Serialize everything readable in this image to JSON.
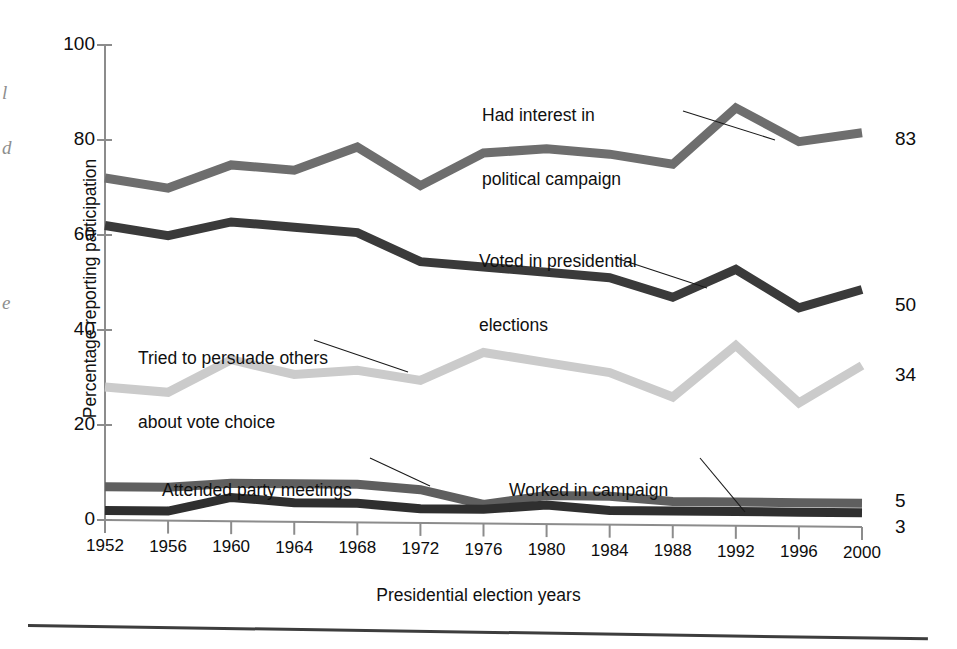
{
  "chart_data": {
    "type": "line",
    "title": "",
    "xlabel": "Presidential election years",
    "ylabel": "Percentage reporting participation",
    "categories": [
      "1952",
      "1956",
      "1960",
      "1964",
      "1968",
      "1972",
      "1976",
      "1980",
      "1984",
      "1988",
      "1992",
      "1996",
      "2000"
    ],
    "x": [
      1952,
      1956,
      1960,
      1964,
      1968,
      1972,
      1976,
      1980,
      1984,
      1988,
      1992,
      1996,
      2000
    ],
    "ylim": [
      0,
      100
    ],
    "yticks": [
      0,
      20,
      40,
      60,
      80,
      100
    ],
    "grid": false,
    "legend_position": "inline-annotations",
    "series": [
      {
        "name": "Had interest in political campaign",
        "color": "#6e6e6e",
        "end_value": 83,
        "values": [
          72,
          70,
          75,
          74,
          79,
          71,
          78,
          79,
          78,
          76,
          88,
          81,
          83
        ]
      },
      {
        "name": "Voted in presidential elections",
        "color": "#3a3a3a",
        "end_value": 50,
        "values": [
          62,
          60,
          63,
          62,
          61,
          55,
          54,
          53,
          52,
          48,
          54,
          46,
          50
        ]
      },
      {
        "name": "Tried to persuade others about vote choice",
        "color": "#cbcbcb",
        "end_value": 34,
        "values": [
          28,
          27,
          34,
          31,
          32,
          30,
          36,
          34,
          32,
          27,
          38,
          26,
          34
        ]
      },
      {
        "name": "Attended party meetings",
        "color": "#5f5f5f",
        "end_value": 5,
        "values": [
          7,
          7,
          8,
          8,
          8,
          7,
          4,
          6,
          6,
          5,
          5,
          5,
          5
        ]
      },
      {
        "name": "Worked in campaign",
        "color": "#2f2f2f",
        "end_value": 3,
        "values": [
          2,
          2,
          5,
          4,
          4,
          3,
          3,
          4,
          3,
          3,
          3,
          3,
          3
        ]
      }
    ]
  },
  "axes": {
    "ytick_labels": [
      "100",
      "80",
      "60",
      "40",
      "20",
      "0"
    ],
    "xtick_labels": [
      "1952",
      "1956",
      "1960",
      "1964",
      "1968",
      "1972",
      "1976",
      "1980",
      "1984",
      "1988",
      "1992",
      "1996",
      "2000"
    ],
    "y_axis_title": "Percentage reporting participation",
    "x_axis_title": "Presidential election years"
  },
  "annotations": [
    {
      "id": "interest",
      "line1": "Had interest in",
      "line2": "political campaign"
    },
    {
      "id": "voted",
      "line1": "Voted in presidential",
      "line2": "elections"
    },
    {
      "id": "persuade",
      "line1": "Tried to persuade others",
      "line2": "about vote choice"
    },
    {
      "id": "attended",
      "line1": "Attended party meetings",
      "line2": ""
    },
    {
      "id": "worked",
      "line1": "Worked in campaign",
      "line2": ""
    }
  ],
  "end_labels": [
    "83",
    "50",
    "34",
    "5",
    "3"
  ],
  "bleed_fragments": [
    "l",
    "d",
    "e"
  ]
}
